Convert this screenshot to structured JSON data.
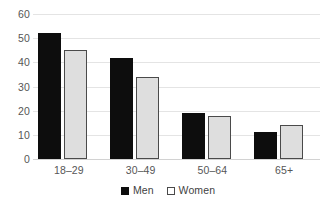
{
  "chart_data": {
    "type": "bar",
    "title": "",
    "subtitle": "",
    "xlabel": "",
    "ylabel": "",
    "categories": [
      "18–29",
      "30–49",
      "50–64",
      "65+"
    ],
    "series": [
      {
        "name": "Men",
        "values": [
          52,
          42,
          19,
          11
        ],
        "color": "#0d0d0d"
      },
      {
        "name": "Women",
        "values": [
          45,
          34,
          18,
          14
        ],
        "color": "#dedede"
      }
    ],
    "ylim": [
      0,
      60
    ],
    "ytick_labels": [
      "60",
      "50",
      "40",
      "30",
      "20",
      "10",
      "0"
    ],
    "ytick_values": [
      60,
      50,
      40,
      30,
      20,
      10,
      0
    ],
    "grid": true,
    "grid_axis": "y",
    "legend": [
      "Men",
      "Women"
    ],
    "legend_position": "bottom-center"
  },
  "legend": {
    "men_label": "Men",
    "women_label": "Women"
  },
  "colors": {
    "men_fill": "#0d0d0d",
    "women_fill": "#dedede",
    "women_border": "#4a4a4a",
    "gridline": "#e4e4e4",
    "text": "#565656",
    "background": "#ffffff"
  }
}
